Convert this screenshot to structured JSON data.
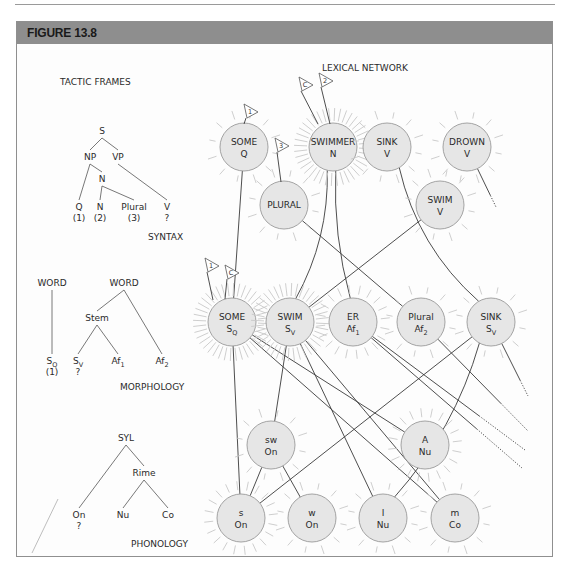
{
  "figure": {
    "title": "FIGURE 13.8",
    "header_color": "#8e8e8e",
    "border_color": "#8f8f8f"
  },
  "left_panel": {
    "tactic_frames_label": "TACTIC FRAMES",
    "syntax": {
      "section_label": "SYNTAX",
      "nodes": [
        {
          "id": "S",
          "text": "S",
          "x": 102,
          "y": 134
        },
        {
          "id": "NP",
          "text": "NP",
          "x": 90,
          "y": 160
        },
        {
          "id": "VP",
          "text": "VP",
          "x": 118,
          "y": 160
        },
        {
          "id": "N1",
          "text": "N",
          "x": 102,
          "y": 182
        },
        {
          "id": "Q",
          "text": "Q",
          "x": 79,
          "y": 210,
          "note": "(1)"
        },
        {
          "id": "N2",
          "text": "N",
          "x": 100,
          "y": 210,
          "note": "(2)"
        },
        {
          "id": "Plural",
          "text": "Plural",
          "x": 134,
          "y": 210,
          "note": "(3)"
        },
        {
          "id": "V",
          "text": "V",
          "x": 167,
          "y": 210,
          "note": "?"
        }
      ],
      "edges": [
        [
          "S",
          "NP"
        ],
        [
          "S",
          "VP"
        ],
        [
          "NP",
          "Q"
        ],
        [
          "NP",
          "N1"
        ],
        [
          "N1",
          "N2"
        ],
        [
          "N1",
          "Plural"
        ],
        [
          "VP",
          "V"
        ]
      ],
      "label_pos": {
        "x": 148,
        "y": 240
      }
    },
    "morphology": {
      "section_label": "MORPHOLOGY",
      "label_pos": {
        "x": 120,
        "y": 390
      },
      "nodes": [
        {
          "id": "W1",
          "text": "WORD",
          "x": 52,
          "y": 286
        },
        {
          "id": "W2",
          "text": "WORD",
          "x": 124,
          "y": 286
        },
        {
          "id": "Stem",
          "text": "Stem",
          "x": 97,
          "y": 321
        },
        {
          "id": "SQ",
          "text": "S",
          "sub": "Q",
          "x": 52,
          "y": 364,
          "note": "(1)"
        },
        {
          "id": "SV",
          "text": "S",
          "sub": "V",
          "x": 78,
          "y": 364,
          "note": "?"
        },
        {
          "id": "Af1",
          "text": "Af",
          "sub": "1",
          "x": 118,
          "y": 364
        },
        {
          "id": "Af2",
          "text": "Af",
          "sub": "2",
          "x": 162,
          "y": 364
        }
      ],
      "edges": [
        [
          "W1",
          "SQ"
        ],
        [
          "W2",
          "Stem"
        ],
        [
          "W2",
          "Af2"
        ],
        [
          "Stem",
          "SV"
        ],
        [
          "Stem",
          "Af1"
        ]
      ]
    },
    "phonology": {
      "section_label": "PHONOLOGY",
      "label_pos": {
        "x": 131,
        "y": 547
      },
      "nodes": [
        {
          "id": "SYL",
          "text": "SYL",
          "x": 126,
          "y": 441
        },
        {
          "id": "Rime",
          "text": "Rime",
          "x": 144,
          "y": 476
        },
        {
          "id": "On",
          "text": "On",
          "x": 79,
          "y": 518,
          "note": "?"
        },
        {
          "id": "Nu",
          "text": "Nu",
          "x": 123,
          "y": 518
        },
        {
          "id": "Co",
          "text": "Co",
          "x": 168,
          "y": 518
        }
      ],
      "edges": [
        [
          "SYL",
          "On"
        ],
        [
          "SYL",
          "Rime"
        ],
        [
          "Rime",
          "Nu"
        ],
        [
          "Rime",
          "Co"
        ]
      ]
    }
  },
  "lexical_network": {
    "title": "LEXICAL NETWORK",
    "node_fill": "#e6e6e6",
    "node_stroke": "#9a9a9a",
    "ray_color": "#c8c8c8",
    "nodes": [
      {
        "id": "some_q",
        "l1": "SOME",
        "l2": "Q",
        "x": 244,
        "y": 147,
        "glow": "light"
      },
      {
        "id": "swimmer_n",
        "l1": "SWIMMER",
        "l2": "N",
        "x": 333,
        "y": 147,
        "glow": "strong"
      },
      {
        "id": "sink_v",
        "l1": "SINK",
        "l2": "V",
        "x": 387,
        "y": 147,
        "glow": "light"
      },
      {
        "id": "drown_v",
        "l1": "DROWN",
        "l2": "V",
        "x": 467,
        "y": 147,
        "glow": "light"
      },
      {
        "id": "plural",
        "l1": "PLURAL",
        "l2": "",
        "x": 284,
        "y": 205,
        "glow": "light"
      },
      {
        "id": "swim_v",
        "l1": "SWIM",
        "l2": "V",
        "x": 440,
        "y": 205,
        "glow": "light"
      },
      {
        "id": "some_sq",
        "l1": "SOME",
        "l2": "S",
        "l2sub": "Q",
        "x": 232,
        "y": 322,
        "glow": "strong"
      },
      {
        "id": "swim_sv",
        "l1": "SWIM",
        "l2": "S",
        "l2sub": "V",
        "x": 290,
        "y": 322,
        "glow": "strong"
      },
      {
        "id": "er_af1",
        "l1": "ER",
        "l2": "Af",
        "l2sub": "1",
        "x": 353,
        "y": 322,
        "glow": "medium"
      },
      {
        "id": "plural_af2",
        "l1": "Plural",
        "l2": "Af",
        "l2sub": "2",
        "x": 421,
        "y": 322,
        "glow": "light"
      },
      {
        "id": "sink_sv",
        "l1": "SINK",
        "l2": "S",
        "l2sub": "V",
        "x": 491,
        "y": 322,
        "glow": "light"
      },
      {
        "id": "sw_on",
        "l1": "sw",
        "l2": "On",
        "x": 271,
        "y": 445,
        "glow": "light"
      },
      {
        "id": "a_nu",
        "l1": "A",
        "l2": "Nu",
        "x": 425,
        "y": 445,
        "glow": "medium"
      },
      {
        "id": "s_on",
        "l1": "s",
        "l2": "On",
        "x": 241,
        "y": 518,
        "glow": "medium"
      },
      {
        "id": "w_on",
        "l1": "w",
        "l2": "On",
        "x": 312,
        "y": 518,
        "glow": "light"
      },
      {
        "id": "i_nu",
        "l1": "I",
        "l2": "Nu",
        "x": 383,
        "y": 518,
        "glow": "light"
      },
      {
        "id": "m_co",
        "l1": "m",
        "l2": "Co",
        "x": 455,
        "y": 518,
        "glow": "light"
      }
    ],
    "edges": [
      {
        "from": "some_q",
        "to": "some_sq"
      },
      {
        "from": "swimmer_n",
        "to": "swim_sv",
        "curve": -18
      },
      {
        "from": "swimmer_n",
        "to": "er_af1",
        "curve": 10
      },
      {
        "from": "sink_v",
        "to": "sink_sv",
        "curve": 25
      },
      {
        "from": "plural",
        "to": "plural_af2"
      },
      {
        "from": "swim_v",
        "to": "swim_sv"
      },
      {
        "from": "some_sq",
        "to": "s_on"
      },
      {
        "from": "some_sq",
        "to": "a_nu"
      },
      {
        "from": "some_sq",
        "to": "m_co"
      },
      {
        "from": "swim_sv",
        "to": "sw_on"
      },
      {
        "from": "swim_sv",
        "to": "i_nu"
      },
      {
        "from": "swim_sv",
        "to": "m_co"
      },
      {
        "from": "sink_sv",
        "to": "s_on"
      },
      {
        "from": "sink_sv",
        "to": "i_nu",
        "curve": -20
      },
      {
        "from": "sw_on",
        "to": "s_on"
      },
      {
        "from": "sw_on",
        "to": "w_on"
      }
    ],
    "dotted_edges": [
      {
        "from": "drown_v",
        "x2": 496,
        "y2": 207
      },
      {
        "from": "sink_sv",
        "x2": 528,
        "y2": 396
      },
      {
        "from": "plural_af2",
        "x2": 528,
        "y2": 431
      },
      {
        "from": "er_af1",
        "x2": 525,
        "y2": 450
      },
      {
        "from": "er_af1",
        "x2": 522,
        "y2": 468
      }
    ],
    "flags": [
      {
        "label": "1",
        "x": 250,
        "y": 118,
        "attach_x": 244,
        "attach_y": 124
      },
      {
        "label": "C",
        "x": 305,
        "y": 91,
        "attach_x": 318,
        "attach_y": 124
      },
      {
        "label": "2",
        "x": 325,
        "y": 87,
        "attach_x": 330,
        "attach_y": 124
      },
      {
        "label": "3",
        "x": 281,
        "y": 152,
        "attach_x": 281,
        "attach_y": 182
      },
      {
        "label": "1",
        "x": 211,
        "y": 272,
        "attach_x": 213,
        "attach_y": 300
      },
      {
        "label": "C",
        "x": 231,
        "y": 279,
        "attach_x": 225,
        "attach_y": 299
      }
    ]
  },
  "footer": {
    "caption_fragment": "Dell (1986)..."
  }
}
